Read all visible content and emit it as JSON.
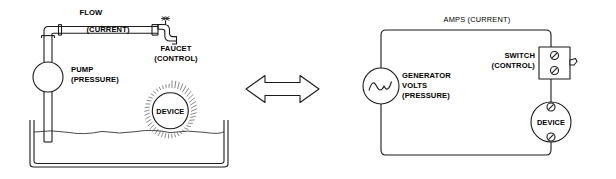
{
  "diagram": {
    "background_color": "#ffffff",
    "line_color": "#1a1a1a",
    "text_color": "#000000"
  },
  "hydraulic": {
    "flow_label": "FLOW",
    "flow_sub_label": "(CURRENT)",
    "faucet_label": "FAUCET",
    "faucet_sub_label": "(CONTROL)",
    "pump_label": "PUMP",
    "pump_sub_label": "(PRESSURE)",
    "device_label": "DEVICE"
  },
  "electrical": {
    "amps_label": "AMPS (CURRENT)",
    "generator_label": "GENERATOR",
    "generator_label2": "VOLTS",
    "generator_sub_label": "(PRESSURE)",
    "switch_label": "SWITCH",
    "switch_sub_label": "(CONTROL)",
    "device_label": "DEVICE"
  },
  "connector": {
    "icon": "double-headed-arrow",
    "direction": "bidirectional"
  }
}
